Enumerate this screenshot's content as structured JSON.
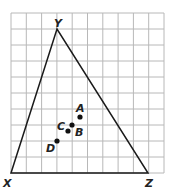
{
  "grid": {
    "left": 11,
    "top": 13,
    "right": 164,
    "bottom": 173,
    "cols": 10,
    "rows": 10,
    "color": "#b8b8b8"
  },
  "triangle": {
    "color": "#1a1a1a",
    "vertices": [
      {
        "name": "X",
        "x": 11,
        "y": 173,
        "label_x": 3,
        "label_y": 187
      },
      {
        "name": "Y",
        "x": 57,
        "y": 29,
        "label_x": 54,
        "label_y": 27
      },
      {
        "name": "Z",
        "x": 148,
        "y": 173,
        "label_x": 145,
        "label_y": 187
      }
    ]
  },
  "points": [
    {
      "name": "A",
      "x": 80,
      "y": 117,
      "label_x": 76,
      "label_y": 112
    },
    {
      "name": "B",
      "x": 72,
      "y": 125,
      "label_x": 75,
      "label_y": 136
    },
    {
      "name": "C",
      "x": 68,
      "y": 131,
      "label_x": 57,
      "label_y": 130
    },
    {
      "name": "D",
      "x": 57,
      "y": 141,
      "label_x": 46,
      "label_y": 152
    }
  ]
}
